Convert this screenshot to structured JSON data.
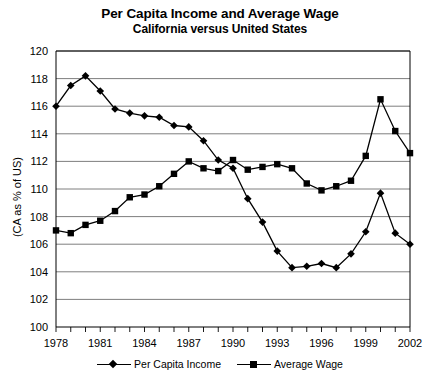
{
  "chart_data": {
    "type": "line",
    "title": "Per Capita Income and Average Wage",
    "subtitle": "California versus United States",
    "xlabel": "",
    "ylabel": "(CA as % of US)",
    "ylim": [
      100,
      120
    ],
    "ytick_step": 2,
    "yticks": [
      100,
      102,
      104,
      106,
      108,
      110,
      112,
      114,
      116,
      118,
      120
    ],
    "xlim": [
      1978,
      2002
    ],
    "xticks_all": [
      1978,
      1979,
      1980,
      1981,
      1982,
      1983,
      1984,
      1985,
      1986,
      1987,
      1988,
      1989,
      1990,
      1991,
      1992,
      1993,
      1994,
      1995,
      1996,
      1997,
      1998,
      1999,
      2000,
      2001,
      2002
    ],
    "xtick_labels": [
      "1978",
      "1981",
      "1984",
      "1987",
      "1990",
      "1993",
      "1996",
      "1999",
      "2002"
    ],
    "xtick_labeled_values": [
      1978,
      1981,
      1984,
      1987,
      1990,
      1993,
      1996,
      1999,
      2002
    ],
    "grid": "horizontal",
    "legend_position": "bottom",
    "x": [
      1978,
      1979,
      1980,
      1981,
      1982,
      1983,
      1984,
      1985,
      1986,
      1987,
      1988,
      1989,
      1990,
      1991,
      1992,
      1993,
      1994,
      1995,
      1996,
      1997,
      1998,
      1999,
      2000,
      2001,
      2002
    ],
    "series": [
      {
        "name": "Per Capita Income",
        "marker": "diamond",
        "values": [
          116.0,
          117.5,
          118.2,
          117.1,
          115.8,
          115.5,
          115.3,
          115.2,
          114.6,
          114.5,
          113.5,
          112.1,
          111.5,
          109.3,
          107.6,
          105.5,
          104.3,
          104.4,
          104.6,
          104.3,
          105.3,
          106.9,
          109.7,
          106.8,
          106.0
        ]
      },
      {
        "name": "Average Wage",
        "marker": "square",
        "values": [
          107.0,
          106.8,
          107.4,
          107.7,
          108.4,
          109.4,
          109.6,
          110.2,
          111.1,
          112.0,
          111.5,
          111.3,
          112.1,
          111.4,
          111.6,
          111.8,
          111.5,
          110.4,
          109.9,
          110.2,
          110.6,
          112.4,
          116.5,
          114.2,
          112.6
        ]
      }
    ]
  }
}
